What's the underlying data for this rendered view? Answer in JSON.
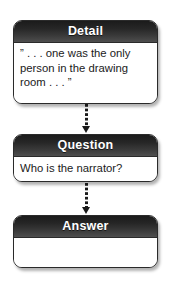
{
  "diagram": {
    "colors": {
      "header_dark": "#1b1b1b",
      "header_light": "#4e4e4e",
      "header_text": "#ffffff",
      "body_background": "#ffffff",
      "body_text": "#1a1a1a",
      "border": "#2a2a2a",
      "connector": "#1a1a1a"
    },
    "nodes": [
      {
        "id": "detail",
        "header": "Detail",
        "lines": [
          "” . . . one was the only",
          "person in the drawing",
          "room . . . ”"
        ]
      },
      {
        "id": "question",
        "header": "Question",
        "lines": [
          "Who is the narrator?"
        ]
      },
      {
        "id": "answer",
        "header": "Answer",
        "lines": [
          ""
        ]
      }
    ],
    "connectors": [
      {
        "id": "detail-to-question",
        "from": "detail",
        "to": "question",
        "style": "dotted",
        "arrow": "down"
      },
      {
        "id": "question-to-answer",
        "from": "question",
        "to": "answer",
        "style": "dotted",
        "arrow": "down"
      }
    ]
  }
}
